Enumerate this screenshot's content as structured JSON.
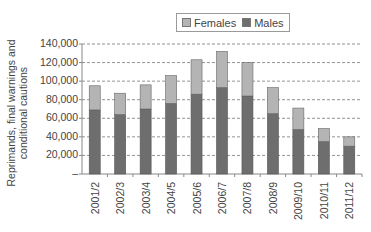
{
  "chart_data": {
    "type": "bar",
    "stacked": true,
    "title": "",
    "xlabel": "",
    "ylabel": "Reprimands, final warnings and conditional cautions",
    "ylabel_lines": [
      "Reprimands, final warnings and",
      "conditional cautions"
    ],
    "ylim": [
      0,
      140000
    ],
    "yticks": [
      0,
      20000,
      40000,
      60000,
      80000,
      100000,
      120000,
      140000
    ],
    "ytick_labels": [
      "–",
      "20,000",
      "40,000",
      "60,000",
      "80,000",
      "100,000",
      "120,000",
      "140,000"
    ],
    "grid": "horizontal dashed",
    "legend_position": "top",
    "categories": [
      "2001/2",
      "2002/3",
      "2003/4",
      "2004/5",
      "2005/6",
      "2006/7",
      "2007/8",
      "2008/9",
      "2009/10",
      "2010/11",
      "2011/12"
    ],
    "series": [
      {
        "name": "Males",
        "color": "#6e6e6e",
        "values": [
          69000,
          64000,
          70000,
          76000,
          86000,
          93000,
          84000,
          65000,
          48000,
          35000,
          30000
        ]
      },
      {
        "name": "Females",
        "color": "#b4b4b4",
        "values": [
          26000,
          23000,
          26000,
          30000,
          37000,
          39000,
          36000,
          28000,
          23000,
          14000,
          10000
        ]
      }
    ],
    "totals": [
      95000,
      87000,
      96000,
      106000,
      123000,
      132000,
      120000,
      93000,
      71000,
      49000,
      40000
    ]
  },
  "legend": {
    "items": [
      {
        "label": "Females",
        "color": "#b4b4b4"
      },
      {
        "label": "Males",
        "color": "#6e6e6e"
      }
    ]
  }
}
